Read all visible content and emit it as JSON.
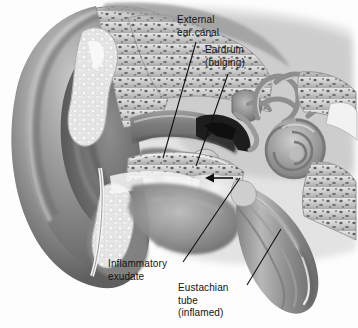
{
  "figure": {
    "width": 358,
    "height": 328,
    "background_color": "#fdfdfd",
    "style": "grayscale medical airbrush illustration"
  },
  "labels": [
    {
      "id": "external-ear-canal",
      "lines": "External\near canal",
      "line_list": [
        "External",
        "ear canal"
      ],
      "text_x": 177,
      "text_y": 14,
      "leader": {
        "x1": 196,
        "y1": 42,
        "x2": 163,
        "y2": 158
      }
    },
    {
      "id": "eardrum",
      "lines": "Eardrum\n(bulging)",
      "line_list": [
        "Eardrum",
        "(bulging)"
      ],
      "text_x": 205,
      "text_y": 44,
      "leader": {
        "x1": 228,
        "y1": 74,
        "x2": 196,
        "y2": 166
      }
    },
    {
      "id": "inflammatory-exudate",
      "lines": "Inflammatory\nexudate",
      "line_list": [
        "Inflammatory",
        "exudate"
      ],
      "text_x": 108,
      "text_y": 258,
      "leader": {
        "x1": 240,
        "y1": 178,
        "x2": 183,
        "y2": 262
      }
    },
    {
      "id": "eustachian-tube",
      "lines": "Eustachian\ntube\n(inflamed)",
      "line_list": [
        "Eustachian",
        "tube",
        "(inflamed)"
      ],
      "text_x": 178,
      "text_y": 282,
      "leader": {
        "x1": 281,
        "y1": 229,
        "x2": 247,
        "y2": 285
      }
    }
  ],
  "annotations": {
    "pressure_arrow": {
      "name": "bulging-pressure-arrow",
      "direction": "left",
      "tail_x": 233,
      "tail_y": 178,
      "tip_x": 205,
      "tip_y": 178,
      "color": "#111111"
    }
  },
  "anatomy_parts": [
    {
      "name": "pinna",
      "label": "Auricle (pinna)"
    },
    {
      "name": "external-ear-canal",
      "label": "External ear canal"
    },
    {
      "name": "eardrum",
      "label": "Eardrum (bulging)"
    },
    {
      "name": "middle-ear-cavity",
      "label": "Middle ear cavity"
    },
    {
      "name": "ossicles",
      "label": "Ossicles"
    },
    {
      "name": "cochlea",
      "label": "Cochlea"
    },
    {
      "name": "semicircular-canals",
      "label": "Semicircular canals"
    },
    {
      "name": "eustachian-tube",
      "label": "Eustachian tube (inflamed)"
    },
    {
      "name": "inflammatory-exudate",
      "label": "Inflammatory exudate"
    },
    {
      "name": "temporal-bone",
      "label": "Temporal bone (porous)"
    }
  ],
  "palette": {
    "line": "#111111",
    "text": "#141414",
    "bone_light": "#d8d8d8",
    "bone_mid": "#b3b3b3",
    "tissue_dark": "#6f6f6f",
    "tissue_mid": "#9a9a9a",
    "tissue_light": "#cfcfcf",
    "exudate": "#ececec",
    "cavity_dark": "#1d1d1d",
    "background": "#fdfdfd"
  }
}
